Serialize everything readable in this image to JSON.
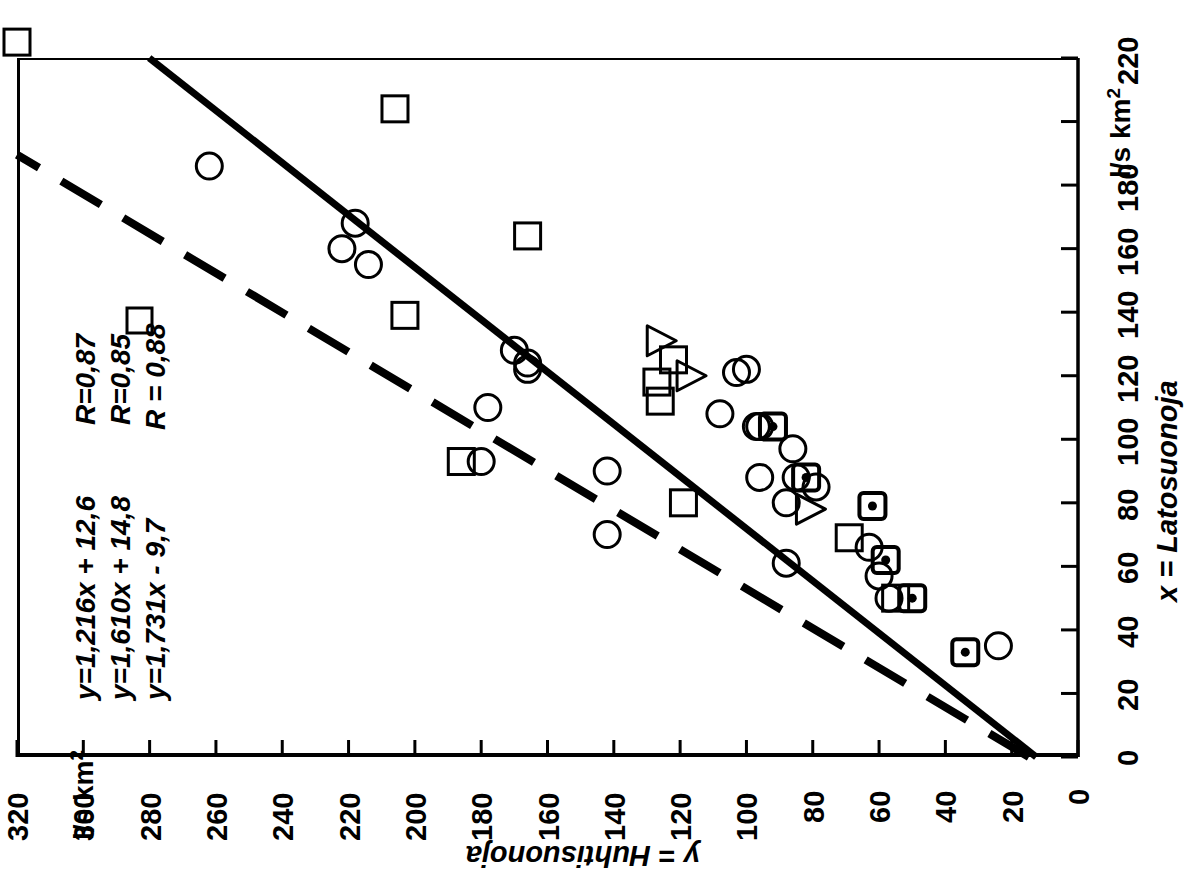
{
  "figure": {
    "orientation": "rotated-90-landscape-print",
    "background": "#ffffff",
    "ink": "#000000"
  },
  "axes": {
    "x": {
      "name": "x = Latosuonoja",
      "unit": "l/s km",
      "unit_exponent": "2",
      "min": 0,
      "max": 220,
      "step": 20,
      "ticks": [
        "0",
        "20",
        "40",
        "60",
        "80",
        "100",
        "120",
        "140",
        "160",
        "180",
        "220"
      ]
    },
    "y": {
      "name": "y = Huhtisuonoja",
      "unit": "l/s km",
      "unit_exponent": "2",
      "min": 0,
      "max": 320,
      "step": 20,
      "ticks": [
        "0",
        "20",
        "40",
        "60",
        "80",
        "100",
        "120",
        "140",
        "160",
        "180",
        "200",
        "220",
        "240",
        "260",
        "280",
        "300",
        "320"
      ]
    }
  },
  "annotations": {
    "equations": [
      "y=1,216x + 12,6",
      "y=1,610x + 14,8",
      "y=1,731x -  9,7"
    ],
    "correlations": [
      "R=0,87",
      "R=0,85",
      "R = 0,88"
    ],
    "legend_marker_row3": "open-square"
  },
  "chart_data": {
    "type": "scatter",
    "title": "",
    "xlabel": "x = Latosuonoja",
    "ylabel": "y = Huhtisuonoja",
    "xunit": "l/s km2",
    "yunit": "l/s km2",
    "xlim": [
      0,
      220
    ],
    "ylim": [
      0,
      320
    ],
    "grid": false,
    "legend": "none",
    "series": [
      {
        "name": "circle",
        "marker": "open-circle",
        "points": [
          [
            186,
            262
          ],
          [
            168,
            218
          ],
          [
            160,
            222
          ],
          [
            155,
            214
          ],
          [
            128,
            170
          ],
          [
            124,
            166
          ],
          [
            122,
            166
          ],
          [
            110,
            178
          ],
          [
            108,
            108
          ],
          [
            93,
            180
          ],
          [
            90,
            142
          ],
          [
            88,
            96
          ],
          [
            121,
            103
          ],
          [
            122,
            100
          ],
          [
            104,
            96
          ],
          [
            104,
            97
          ],
          [
            97,
            86
          ],
          [
            88,
            85
          ],
          [
            85,
            79
          ],
          [
            80,
            88
          ],
          [
            70,
            142
          ],
          [
            66,
            63
          ],
          [
            61,
            88
          ],
          [
            57,
            60
          ],
          [
            50,
            57
          ],
          [
            35,
            24
          ]
        ]
      },
      {
        "name": "square",
        "marker": "open-square",
        "points": [
          [
            225,
            320
          ],
          [
            204,
            206
          ],
          [
            164,
            166
          ],
          [
            139,
            203
          ],
          [
            125,
            122
          ],
          [
            118,
            127
          ],
          [
            112,
            126
          ],
          [
            93,
            186
          ],
          [
            80,
            119
          ],
          [
            69,
            69
          ],
          [
            50,
            55
          ]
        ]
      },
      {
        "name": "dotted-square",
        "marker": "dotted-square",
        "points": [
          [
            104,
            92
          ],
          [
            88,
            82
          ],
          [
            79,
            62
          ],
          [
            62,
            58
          ],
          [
            50,
            50
          ],
          [
            33,
            34
          ]
        ]
      },
      {
        "name": "triangle",
        "marker": "open-triangle-right",
        "points": [
          [
            131,
            126
          ],
          [
            120,
            117
          ],
          [
            78,
            81
          ]
        ]
      }
    ],
    "fits": [
      {
        "name": "solid-regression",
        "style": "solid",
        "equation": "y=1,216x + 12,6",
        "slope": 1.216,
        "intercept": 12.6,
        "R": 0.87,
        "x_from": 0,
        "x_to": 220
      },
      {
        "name": "dashed-regression",
        "style": "dashed",
        "equation": "y=1,610x + 14,8",
        "slope": 1.61,
        "intercept": 14.8,
        "R": 0.85,
        "x_from": 0,
        "x_to": 220
      },
      {
        "name": "third-regression",
        "style": "not-drawn",
        "equation": "y=1,731x -  9,7",
        "slope": 1.731,
        "intercept": -9.7,
        "R": 0.88
      }
    ]
  }
}
